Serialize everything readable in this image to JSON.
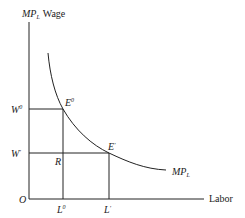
{
  "diagram": {
    "y_axis_label": {
      "main": "MP",
      "sub": "L",
      "suffix": "Wage"
    },
    "x_axis_label": "Labor",
    "origin_label": "O",
    "wage_labels": {
      "w0": {
        "main": "W",
        "sup": "0"
      },
      "w1": {
        "main": "W",
        "sup": "′"
      }
    },
    "labor_labels": {
      "l0": {
        "main": "L",
        "sup": "0"
      },
      "l1": {
        "main": "L",
        "sup": "′"
      }
    },
    "points": {
      "e0": {
        "main": "E",
        "sup": "0"
      },
      "e1": {
        "main": "E",
        "sup": "′"
      },
      "r": "R"
    },
    "curve_label": {
      "main": "MP",
      "sub": "L"
    },
    "colors": {
      "line": "#222222",
      "background": "#ffffff"
    }
  }
}
